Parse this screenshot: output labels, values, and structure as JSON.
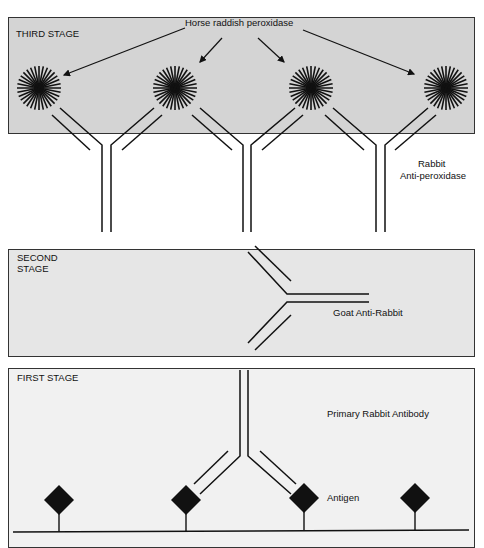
{
  "diagram": {
    "type": "immunohistochemistry PAP method schematic",
    "panels": [
      {
        "id": "third",
        "stage_label": "THIRD STAGE",
        "annotations": {
          "enzyme": "Horse raddish peroxidase",
          "antibody_line1": "Rabbit",
          "antibody_line2": "Anti-peroxidase"
        }
      },
      {
        "id": "second",
        "stage_label_line1": "SECOND",
        "stage_label_line2": "STAGE",
        "annotations": {
          "antibody": "Goat Anti-Rabbit"
        }
      },
      {
        "id": "first",
        "stage_label": "FIRST STAGE",
        "annotations": {
          "antibody": "Primary Rabbit Antibody",
          "antigen": "Antigen"
        }
      }
    ],
    "colors": {
      "ink": "#111111",
      "third_bg": "#d4d4d4",
      "second_bg": "#e6e6e6",
      "first_bg": "#f1f1f1"
    }
  }
}
